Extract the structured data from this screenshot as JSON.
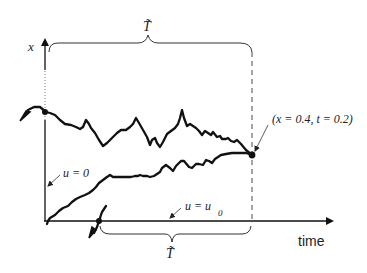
{
  "diagram": {
    "type": "stochastic path / characteristic diagram",
    "axes": {
      "y_label": "x",
      "x_label": "time"
    },
    "braces": {
      "top_label": "T̃",
      "bottom_label": "T̃"
    },
    "annotations": {
      "point_label": "(x = 0.4, t = 0.2)",
      "left_boundary_label": "u = 0",
      "bottom_boundary_label_main": "u = u",
      "bottom_boundary_label_sub": "0"
    },
    "paths": [
      {
        "name": "upper-path",
        "description": "random path from left boundary (x-axis) to endpoint, heading backward in time"
      },
      {
        "name": "lower-path",
        "description": "random path from bottom boundary (time axis) to endpoint"
      }
    ],
    "colors": {
      "ink": "#111111",
      "background": "#ffffff"
    }
  }
}
